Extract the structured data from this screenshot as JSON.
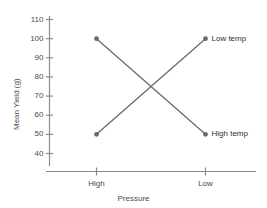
{
  "chart_data": {
    "type": "line",
    "title": "",
    "xlabel": "Pressure",
    "ylabel": "Mean Yield (g)",
    "categories": [
      "High",
      "Low"
    ],
    "series": [
      {
        "name": "High temp",
        "values": [
          100,
          50
        ]
      },
      {
        "name": "Low temp",
        "values": [
          50,
          100
        ]
      }
    ],
    "ylim": [
      35,
      113
    ],
    "yticks": [
      40,
      50,
      60,
      70,
      80,
      90,
      100,
      110
    ],
    "ytick_labels": [
      "40",
      "50",
      "60",
      "70",
      "80",
      "90",
      "100",
      "110"
    ],
    "xtick_labels": [
      "High",
      "Low"
    ],
    "grid": false,
    "legend": "inline-right-of-endpoints",
    "annotations": [
      {
        "text": "Low temp",
        "at_category": "Low",
        "value": 100
      },
      {
        "text": "High temp",
        "at_category": "Low",
        "value": 50
      }
    ],
    "crossing_point": {
      "approx_value": 75
    },
    "colors": {
      "line": "#6a6a6a",
      "marker": "#6a6a6a",
      "axis": "#8a8a8a",
      "text": "#3a3a3a",
      "background": "#ffffff"
    }
  }
}
